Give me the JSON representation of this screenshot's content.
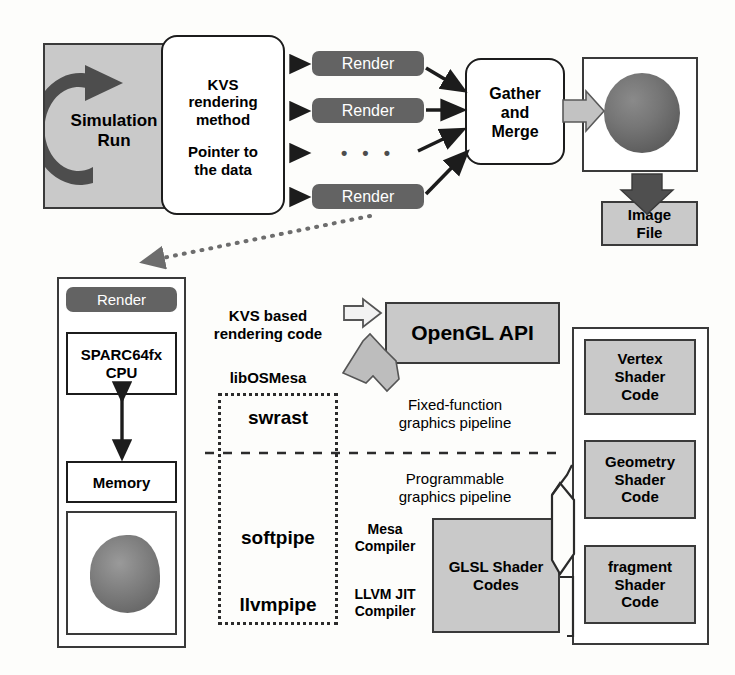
{
  "colors": {
    "gray_fill": "#c9c9c9",
    "dark_fill": "#636363",
    "outline": "#1c1c1c",
    "sphere": "#6e6e6e",
    "page_bg": "#fdfdfb"
  },
  "top_section": {
    "simulation_box": {
      "label": "Simulation\nRun",
      "icon": "circular-arrow-icon"
    },
    "kvs_box": {
      "line1": "KVS",
      "line2": "rendering",
      "line3": "method",
      "line4": "Pointer to",
      "line5": "the data"
    },
    "render_nodes": [
      {
        "label": "Render"
      },
      {
        "label": "Render"
      },
      {
        "label": "Render"
      }
    ],
    "ellipsis": "• • •",
    "gather_box": {
      "line1": "Gather",
      "line2": "and",
      "line3": "Merge"
    },
    "image_preview": {
      "name": "rendered-sphere-image"
    },
    "image_file_box": {
      "line1": "Image",
      "line2": "File"
    }
  },
  "bottom_section": {
    "node_panel": {
      "render_label": "Render",
      "cpu_box": {
        "line1": "SPARC64fx",
        "line2": "CPU"
      },
      "memory_box": {
        "label": "Memory"
      },
      "result_image": {
        "name": "rendered-blob-image"
      }
    },
    "kvs_code_label": {
      "line1": "KVS based",
      "line2": "rendering code"
    },
    "libosmesa_label": "libOSMesa",
    "opengl_box": {
      "label": "OpenGL API"
    },
    "drivers": [
      {
        "label": "swrast"
      },
      {
        "label": "softpipe"
      },
      {
        "label": "llvmpipe"
      }
    ],
    "pipelines": [
      {
        "line1": "Fixed-function",
        "line2": "graphics pipeline"
      },
      {
        "line1": "Programmable",
        "line2": "graphics pipeline"
      }
    ],
    "compilers": [
      {
        "line1": "Mesa",
        "line2": "Compiler"
      },
      {
        "line1": "LLVM JIT",
        "line2": "Compiler"
      }
    ],
    "glsl_box": {
      "line1": "GLSL Shader",
      "line2": "Codes"
    },
    "shader_codes": [
      {
        "line1": "Vertex",
        "line2": "Shader",
        "line3": "Code"
      },
      {
        "line1": "Geometry",
        "line2": "Shader",
        "line3": "Code"
      },
      {
        "line1": "fragment",
        "line2": "Shader",
        "line3": "Code"
      }
    ]
  }
}
